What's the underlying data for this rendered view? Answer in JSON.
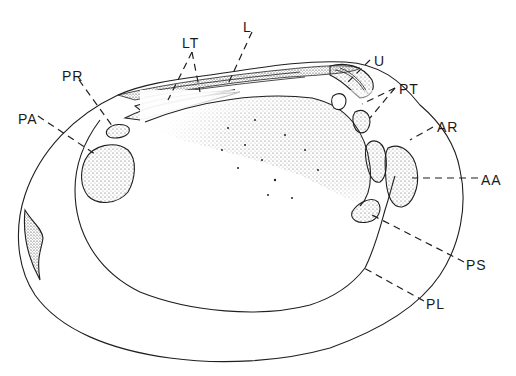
{
  "figure": {
    "labels": [
      {
        "id": "L",
        "text": "L",
        "x": 243,
        "y": 20
      },
      {
        "id": "LT",
        "text": "LT",
        "x": 182,
        "y": 36
      },
      {
        "id": "U",
        "text": "U",
        "x": 374,
        "y": 54
      },
      {
        "id": "PT",
        "text": "PT",
        "x": 399,
        "y": 82
      },
      {
        "id": "PR",
        "text": "PR",
        "x": 62,
        "y": 69
      },
      {
        "id": "PA",
        "text": "PA",
        "x": 18,
        "y": 112
      },
      {
        "id": "AR",
        "text": "AR",
        "x": 437,
        "y": 120
      },
      {
        "id": "AA",
        "text": "AA",
        "x": 481,
        "y": 173
      },
      {
        "id": "PS",
        "text": "PS",
        "x": 466,
        "y": 258
      },
      {
        "id": "PL",
        "text": "PL",
        "x": 426,
        "y": 297
      }
    ],
    "colors": {
      "ink": "#1f1f1f",
      "background": "#ffffff"
    }
  }
}
